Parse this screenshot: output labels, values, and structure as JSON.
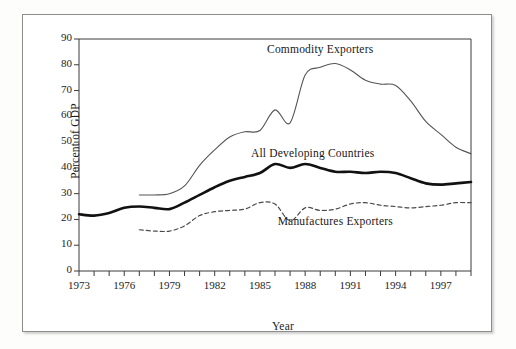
{
  "chart_data": {
    "type": "line",
    "title": "",
    "xlabel": "Year",
    "ylabel": "Percent of GDP",
    "xlim": [
      1973,
      1999
    ],
    "ylim": [
      0,
      90
    ],
    "ytick_step": 10,
    "yticks": [
      0,
      10,
      20,
      30,
      40,
      50,
      60,
      70,
      80,
      90
    ],
    "xticks_labeled": [
      1973,
      1976,
      1979,
      1982,
      1985,
      1988,
      1991,
      1994,
      1997
    ],
    "xtick_minor_step": 1,
    "grid": false,
    "legend": "inline-annotations",
    "series": [
      {
        "name": "Commodity Exporters",
        "style": "thin-solid",
        "color": "#555555",
        "label_x": 1989.0,
        "label_y": 85.5,
        "x": [
          1977,
          1978,
          1979,
          1980,
          1981,
          1982,
          1983,
          1984,
          1985,
          1986,
          1987,
          1988,
          1989,
          1990,
          1991,
          1992,
          1993,
          1994,
          1995,
          1996,
          1997,
          1998,
          1999
        ],
        "values": [
          29.5,
          29.5,
          30.0,
          33.0,
          41.0,
          47.0,
          52.0,
          54.0,
          54.5,
          62.5,
          57.5,
          76.0,
          79.0,
          80.5,
          78.0,
          74.0,
          72.5,
          72.0,
          66.0,
          58.0,
          53.0,
          48.0,
          45.5
        ]
      },
      {
        "name": "All Developing Countries",
        "style": "thick-solid",
        "color": "#111111",
        "label_x": 1988.5,
        "label_y": 45.0,
        "x": [
          1973,
          1974,
          1975,
          1976,
          1977,
          1978,
          1979,
          1980,
          1981,
          1982,
          1983,
          1984,
          1985,
          1986,
          1987,
          1988,
          1989,
          1990,
          1991,
          1992,
          1993,
          1994,
          1995,
          1996,
          1997,
          1998,
          1999
        ],
        "values": [
          22.0,
          21.5,
          22.5,
          24.5,
          25.0,
          24.5,
          24.0,
          26.5,
          29.5,
          32.5,
          35.0,
          36.5,
          38.0,
          41.5,
          40.0,
          41.5,
          40.0,
          38.5,
          38.5,
          38.0,
          38.5,
          38.0,
          36.0,
          34.0,
          33.5,
          34.0,
          34.5
        ]
      },
      {
        "name": "Manufactures Exporters",
        "style": "dashed",
        "color": "#4a4a4a",
        "label_x": 1990.0,
        "label_y": 18.5,
        "x": [
          1977,
          1978,
          1979,
          1980,
          1981,
          1982,
          1983,
          1984,
          1985,
          1986,
          1987,
          1988,
          1989,
          1990,
          1991,
          1992,
          1993,
          1994,
          1995,
          1996,
          1997,
          1998,
          1999
        ],
        "values": [
          16.0,
          15.5,
          15.5,
          17.5,
          21.5,
          23.0,
          23.5,
          24.0,
          26.5,
          26.0,
          19.5,
          24.5,
          23.5,
          24.0,
          26.0,
          26.5,
          25.5,
          25.0,
          24.5,
          25.0,
          25.5,
          26.5,
          26.5
        ]
      }
    ]
  },
  "colors": {
    "frame_border": "#8d8d8d",
    "axis": "#3a3a3a",
    "background": "#ffffff",
    "page_background": "#fdfdfc"
  }
}
